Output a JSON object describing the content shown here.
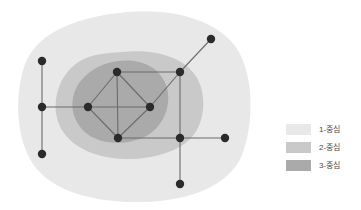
{
  "figure": {
    "type": "network-diagram",
    "background": "#ffffff"
  },
  "chart_data": {
    "type": "scatter",
    "title": "",
    "xlabel": "",
    "ylabel": "",
    "grid": false,
    "legend_position": "right",
    "node_color": "#2b2b2b",
    "edge_color": "#6b6b6b",
    "nodes": [
      {
        "id": "n1",
        "x": 42,
        "y": 61
      },
      {
        "id": "n2",
        "x": 42,
        "y": 107
      },
      {
        "id": "n3",
        "x": 42,
        "y": 154
      },
      {
        "id": "n4",
        "x": 88,
        "y": 107
      },
      {
        "id": "n5",
        "x": 117,
        "y": 72
      },
      {
        "id": "n6",
        "x": 118,
        "y": 138
      },
      {
        "id": "n7",
        "x": 150,
        "y": 107
      },
      {
        "id": "n8",
        "x": 180,
        "y": 72
      },
      {
        "id": "n9",
        "x": 211,
        "y": 39
      },
      {
        "id": "n10",
        "x": 180,
        "y": 138
      },
      {
        "id": "n11",
        "x": 225,
        "y": 138
      },
      {
        "id": "n12",
        "x": 180,
        "y": 184
      }
    ],
    "edges": [
      [
        "n1",
        "n2"
      ],
      [
        "n2",
        "n3"
      ],
      [
        "n2",
        "n4"
      ],
      [
        "n4",
        "n5"
      ],
      [
        "n4",
        "n6"
      ],
      [
        "n4",
        "n7"
      ],
      [
        "n5",
        "n6"
      ],
      [
        "n5",
        "n7"
      ],
      [
        "n5",
        "n8"
      ],
      [
        "n6",
        "n7"
      ],
      [
        "n6",
        "n10"
      ],
      [
        "n7",
        "n8"
      ],
      [
        "n8",
        "n9"
      ],
      [
        "n8",
        "n10"
      ],
      [
        "n10",
        "n11"
      ],
      [
        "n10",
        "n12"
      ]
    ],
    "regions": [
      {
        "level": 1,
        "label": "1-중심",
        "color": "#e8e8e8"
      },
      {
        "level": 2,
        "label": "2-중심",
        "color": "#c9c9c9"
      },
      {
        "level": 3,
        "label": "3-중심",
        "color": "#aaaaaa"
      }
    ]
  },
  "legend": {
    "items": [
      {
        "label": "1-중심",
        "color": "#e8e8e8"
      },
      {
        "label": "2-중심",
        "color": "#c9c9c9"
      },
      {
        "label": "3-중심",
        "color": "#aaaaaa"
      }
    ]
  }
}
